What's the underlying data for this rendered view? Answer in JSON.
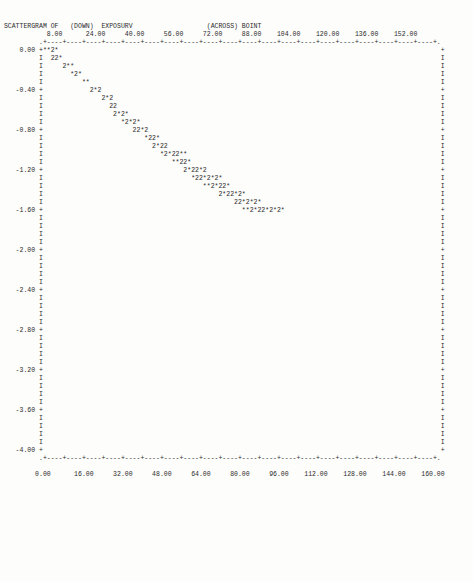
{
  "report": {
    "title_prefix": "SCATTERGRAM OF",
    "down_label": "(DOWN)",
    "down_variable": "EXPOSURV",
    "across_label": "(ACROSS)",
    "across_variable": "BOINT"
  },
  "chart_data": {
    "type": "scatter",
    "title": "SCATTERGRAM OF   (DOWN) EXPOSURV                    (ACROSS) BOINT",
    "xlabel": "BOINT",
    "ylabel": "EXPOSURV",
    "grid": false,
    "legend": "none",
    "xlim": [
      0.0,
      160.0
    ],
    "ylim": [
      -4.0,
      0.0
    ],
    "top_axis_ticks": [
      "8.00",
      "24.00",
      "40.00",
      "56.00",
      "72.00",
      "88.00",
      "104.00",
      "120.00",
      "136.00",
      "152.00"
    ],
    "bottom_axis_ticks": [
      "0.00",
      "16.00",
      "32.00",
      "48.00",
      "64.00",
      "80.00",
      "96.00",
      "112.00",
      "128.00",
      "144.00",
      "160.00"
    ],
    "y_axis_ticks": [
      "0.00",
      "-0.40",
      "-0.80",
      "-1.20",
      "-1.60",
      "-2.00",
      "-2.40",
      "-2.80",
      "-3.20",
      "-3.60",
      "-4.00"
    ],
    "marker_glyphs": {
      "single": "*",
      "double": "2",
      "axis_tick": "+",
      "axis_fill": "I",
      "border_dash": "-",
      "border_corner": "."
    },
    "x": [
      2,
      4,
      6,
      12,
      14,
      16,
      22,
      26,
      30,
      32,
      38,
      40,
      42,
      46,
      48,
      52,
      56,
      58,
      62,
      64,
      68,
      70,
      74,
      76,
      80,
      84,
      88,
      92,
      96,
      100,
      104,
      108,
      112,
      116,
      120,
      124,
      128,
      132,
      136,
      140,
      144,
      148,
      152,
      156
    ],
    "y": [
      0.0,
      0.0,
      -0.08,
      -0.12,
      -0.16,
      -0.24,
      -0.28,
      -0.36,
      -0.44,
      -0.48,
      -0.56,
      -0.6,
      -0.68,
      -0.72,
      -0.8,
      -0.84,
      -0.92,
      -0.96,
      -1.04,
      -1.08,
      -1.16,
      -1.2,
      -1.28,
      -1.32,
      -1.4,
      -1.44,
      -1.52,
      -1.56,
      -1.64,
      -1.68,
      -1.72,
      -1.76,
      -1.8,
      -1.8,
      -1.8,
      -1.8,
      -1.8,
      -1.8,
      -1.8,
      -1.8,
      -1.8,
      -1.8,
      -1.8,
      -1.8
    ],
    "counts_note": "* = 1 case, 2 = 2 cases"
  },
  "plot_rows": [
    {
      "label": "",
      "tick": ".",
      "content": "+----+----+----+----+----+----+----+----+----+----+----+----+----+----+----+----+----+----+----+----+.",
      "kind": "border"
    },
    {
      "label": "0.00",
      "tick": "+",
      "content": "**2*",
      "right": "+"
    },
    {
      "label": "",
      "tick": "I",
      "content": "  22*",
      "right": "I"
    },
    {
      "label": "",
      "tick": "I",
      "content": "     2**",
      "right": "I"
    },
    {
      "label": "",
      "tick": "I",
      "content": "       *2*",
      "right": "I"
    },
    {
      "label": "",
      "tick": "I",
      "content": "          **",
      "right": "I"
    },
    {
      "label": "-0.40",
      "tick": "+",
      "content": "            2*2",
      "right": "+"
    },
    {
      "label": "",
      "tick": "I",
      "content": "               2*2",
      "right": "I"
    },
    {
      "label": "",
      "tick": "I",
      "content": "                 22",
      "right": "I"
    },
    {
      "label": "",
      "tick": "I",
      "content": "                  2*2*",
      "right": "I"
    },
    {
      "label": "",
      "tick": "I",
      "content": "                    *2*2*",
      "right": "I"
    },
    {
      "label": "-0.80",
      "tick": "+",
      "content": "                       22*2",
      "right": "+"
    },
    {
      "label": "",
      "tick": "I",
      "content": "                          *22*",
      "right": "I"
    },
    {
      "label": "",
      "tick": "I",
      "content": "                            2*22",
      "right": "I"
    },
    {
      "label": "",
      "tick": "I",
      "content": "                              *2*22**",
      "right": "I"
    },
    {
      "label": "",
      "tick": "I",
      "content": "                                 **22*",
      "right": "I"
    },
    {
      "label": "-1.20",
      "tick": "+",
      "content": "                                    2*22*2",
      "right": "+"
    },
    {
      "label": "",
      "tick": "I",
      "content": "                                      *22*2*2*",
      "right": "I"
    },
    {
      "label": "",
      "tick": "I",
      "content": "                                         **2*22*",
      "right": "I"
    },
    {
      "label": "",
      "tick": "I",
      "content": "                                             2*22*2*",
      "right": "I"
    },
    {
      "label": "",
      "tick": "I",
      "content": "                                                 22*2*2*",
      "right": "I"
    },
    {
      "label": "-1.60",
      "tick": "+",
      "content": "                                                   **2*22*2*2*",
      "right": "+"
    },
    {
      "label": "",
      "tick": "I",
      "content": "",
      "right": "I"
    },
    {
      "label": "",
      "tick": "I",
      "content": "",
      "right": "I"
    },
    {
      "label": "",
      "tick": "I",
      "content": "",
      "right": "I"
    },
    {
      "label": "",
      "tick": "I",
      "content": "",
      "right": "I"
    },
    {
      "label": "-2.00",
      "tick": "+",
      "content": "",
      "right": "+"
    },
    {
      "label": "",
      "tick": "I",
      "content": "",
      "right": "I"
    },
    {
      "label": "",
      "tick": "I",
      "content": "",
      "right": "I"
    },
    {
      "label": "",
      "tick": "I",
      "content": "",
      "right": "I"
    },
    {
      "label": "",
      "tick": "I",
      "content": "",
      "right": "I"
    },
    {
      "label": "-2.40",
      "tick": "+",
      "content": "",
      "right": "+"
    },
    {
      "label": "",
      "tick": "I",
      "content": "",
      "right": "I"
    },
    {
      "label": "",
      "tick": "I",
      "content": "",
      "right": "I"
    },
    {
      "label": "",
      "tick": "I",
      "content": "",
      "right": "I"
    },
    {
      "label": "",
      "tick": "I",
      "content": "",
      "right": "I"
    },
    {
      "label": "-2.80",
      "tick": "+",
      "content": "",
      "right": "+"
    },
    {
      "label": "",
      "tick": "I",
      "content": "",
      "right": "I"
    },
    {
      "label": "",
      "tick": "I",
      "content": "",
      "right": "I"
    },
    {
      "label": "",
      "tick": "I",
      "content": "",
      "right": "I"
    },
    {
      "label": "",
      "tick": "I",
      "content": "",
      "right": "I"
    },
    {
      "label": "-3.20",
      "tick": "+",
      "content": "",
      "right": "+"
    },
    {
      "label": "",
      "tick": "I",
      "content": "",
      "right": "I"
    },
    {
      "label": "",
      "tick": "I",
      "content": "",
      "right": "I"
    },
    {
      "label": "",
      "tick": "I",
      "content": "",
      "right": "I"
    },
    {
      "label": "",
      "tick": "I",
      "content": "",
      "right": "I"
    },
    {
      "label": "-3.60",
      "tick": "+",
      "content": "",
      "right": "+"
    },
    {
      "label": "",
      "tick": "I",
      "content": "",
      "right": "I"
    },
    {
      "label": "",
      "tick": "I",
      "content": "",
      "right": "I"
    },
    {
      "label": "",
      "tick": "I",
      "content": "",
      "right": "I"
    },
    {
      "label": "",
      "tick": "I",
      "content": "",
      "right": "I"
    },
    {
      "label": "-4.00",
      "tick": "+",
      "content": "",
      "right": "+"
    },
    {
      "label": "",
      "tick": ".",
      "content": "+----+----+----+----+----+----+----+----+----+----+----+----+----+----+----+----+----+----+----+----+.",
      "kind": "border"
    }
  ]
}
